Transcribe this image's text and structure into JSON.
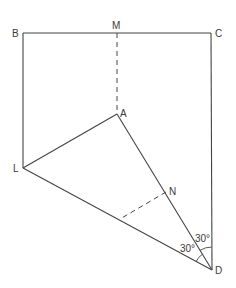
{
  "diagram": {
    "type": "geometry",
    "line_color": "#444444",
    "points": {
      "B": {
        "label": "B",
        "x": 23,
        "y": 33
      },
      "M": {
        "label": "M",
        "x": 117,
        "y": 33
      },
      "C": {
        "label": "C",
        "x": 211,
        "y": 33
      },
      "A": {
        "label": "A",
        "x": 117,
        "y": 114
      },
      "L": {
        "label": "L",
        "x": 23,
        "y": 168
      },
      "N": {
        "label": "N",
        "x": 166,
        "y": 192
      },
      "D": {
        "label": "D",
        "x": 212,
        "y": 270
      }
    },
    "solid_segments": [
      "BC",
      "BL",
      "CD",
      "LA",
      "AD",
      "LD"
    ],
    "dashed_segments": [
      "MA",
      "N-foot on LD"
    ],
    "angles": [
      {
        "label": "30°",
        "between": "AD and CD",
        "vertex": "D"
      },
      {
        "label": "30°",
        "between": "LD and AD",
        "vertex": "D"
      }
    ]
  }
}
